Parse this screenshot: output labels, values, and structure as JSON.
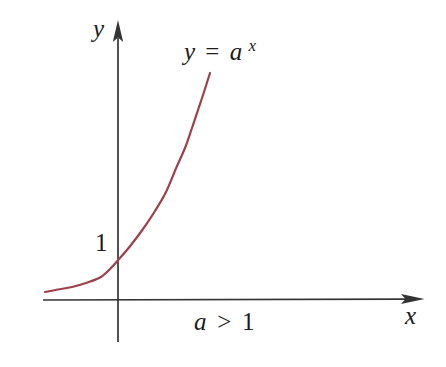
{
  "colors": {
    "background": "#ffffff",
    "curve": "#9e4049",
    "axis": "#343434",
    "text": "#1c1c1c"
  },
  "labels": {
    "y_axis": "y",
    "x_axis": "x",
    "unit_tick": "1",
    "curve": {
      "lhs": "y",
      "eq": "=",
      "base": "a",
      "exp": "x"
    },
    "condition": {
      "var": "a",
      "op": ">",
      "val": "1"
    }
  },
  "chart_data": {
    "type": "line",
    "function": "y = a^x",
    "condition": "a > 1",
    "xlabel": "x",
    "ylabel": "y",
    "y_intercept": 1,
    "horizontal_asymptote_y": 0,
    "axes_numeric_scale": false,
    "visible_tick_labels": {
      "y": [
        "1"
      ],
      "x": []
    },
    "grid": false,
    "legend": "none",
    "curve_screen_points": [
      [
        45,
        292
      ],
      [
        58,
        289.5
      ],
      [
        72,
        287
      ],
      [
        86,
        283
      ],
      [
        100,
        277.5
      ],
      [
        110,
        269
      ],
      [
        120,
        258
      ],
      [
        131,
        245
      ],
      [
        143,
        229
      ],
      [
        155,
        211
      ],
      [
        166,
        192
      ],
      [
        177,
        166
      ],
      [
        185,
        148
      ],
      [
        192,
        128
      ],
      [
        198,
        110
      ],
      [
        204,
        92
      ],
      [
        210,
        73
      ]
    ],
    "axes_screen": {
      "origin": [
        118,
        300
      ],
      "x_axis": {
        "from": [
          43,
          300
        ],
        "tip": [
          424,
          299
        ]
      },
      "y_axis": {
        "from": [
          118,
          342
        ],
        "tip": [
          118,
          21
        ]
      },
      "unit_y_px": 42
    }
  }
}
